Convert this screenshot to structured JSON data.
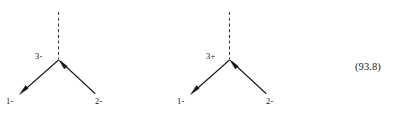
{
  "figure": {
    "background_color": "#ffffff",
    "ink_color": "#161616",
    "dash_color": "#3a3a3a",
    "diagrams": [
      {
        "id": "left-diagram",
        "vertex_label": "3-",
        "axis_style": "dashed-vertical",
        "branches": [
          {
            "id": "lower-left",
            "label": "1-",
            "arrowhead": "outward-at-tip"
          },
          {
            "id": "lower-right",
            "label": "2-",
            "arrowhead": "inward-at-vertex"
          }
        ]
      },
      {
        "id": "right-diagram",
        "vertex_label": "3+",
        "axis_style": "dashed-vertical",
        "branches": [
          {
            "id": "lower-left",
            "label": "1-",
            "arrowhead": "outward-at-tip"
          },
          {
            "id": "lower-right",
            "label": "2-",
            "arrowhead": "inward-at-vertex"
          }
        ]
      }
    ],
    "annotation": {
      "value": "(93.8)"
    }
  }
}
